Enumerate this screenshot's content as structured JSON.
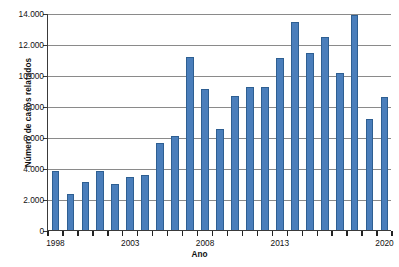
{
  "chart_data": {
    "type": "bar",
    "title": "",
    "subtitle": "",
    "xlabel": "Ano",
    "ylabel": "Número de casos relatados",
    "ylim": [
      0,
      14000
    ],
    "ytick_labels": [
      "0",
      "2.000",
      "4.000",
      "6.000",
      "8.000",
      "10.000",
      "12.000",
      "14.000"
    ],
    "ytick_values": [
      0,
      2000,
      4000,
      6000,
      8000,
      10000,
      12000,
      14000
    ],
    "grid": true,
    "legend": null,
    "legend_position": "none",
    "bar_color": "#4a7ebb",
    "bar_edge_color": "#2e5f92",
    "axis_color": "#3a3a3a",
    "gridline_color": "#8a8a8a",
    "categories": [
      "1998",
      "1999",
      "2000",
      "2001",
      "2002",
      "2003",
      "2004",
      "2005",
      "2006",
      "2007",
      "2008",
      "2009",
      "2010",
      "2011",
      "2012",
      "2013",
      "2014",
      "2015",
      "2016",
      "2017",
      "2018",
      "2019",
      "2020"
    ],
    "values": [
      3800,
      2350,
      3100,
      3800,
      3000,
      3450,
      3570,
      5620,
      6080,
      11150,
      9100,
      6530,
      8620,
      9200,
      9200,
      11120,
      13400,
      11400,
      12480,
      10150,
      13900,
      7150,
      8600
    ],
    "xtick_labels": [
      "1998",
      "2003",
      "2008",
      "2013",
      "2020"
    ],
    "xtick_categories": [
      "1998",
      "2003",
      "2008",
      "2013",
      "2020"
    ]
  }
}
